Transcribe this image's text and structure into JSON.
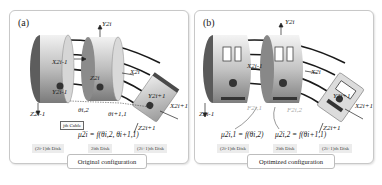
{
  "panels": [
    {
      "tag": "(a)",
      "caption": "Original configuration",
      "axis_labels": {
        "y_2i": "Y2i",
        "x_2i_minus_1": "X2i-1",
        "z_2i": "Z2i",
        "x_2i": "X2i",
        "y_2i_minus_1": "Y2i-1",
        "z_2i_minus_1": "Z2i-1",
        "y_2i_plus_1": "Y2i+1",
        "x_2i_plus_1": "X2i+1",
        "z_2i_plus_1": "Z2i+1",
        "theta_i2": "θi,2",
        "theta_i_plus_1_1": "θi+1,1"
      },
      "cable_label": "jth Cable",
      "equation": "μ2i = f(θi,2, θi+1,1)",
      "disks": [
        "(2i-1)th Disk",
        "2ith Disk",
        "(2i+1)th Disk"
      ]
    },
    {
      "tag": "(b)",
      "caption": "Optimized configuration",
      "axis_labels": {
        "y_2i": "Y2i",
        "x_2i_minus_1": "X2i-1",
        "x_2i": "X2i",
        "z_2i_minus_1": "Z2i-1",
        "y_2i_plus_1": "Y2i+1",
        "x_2i_plus_1": "X2i+1",
        "z_2i_plus_1": "Z2i+1",
        "f_left": "F2i,1",
        "f_right": "F2i,2"
      },
      "equations": [
        "μ2i,1 = f(θi,2)",
        "μ2i,2 = f(θi+1,1)"
      ],
      "disks": [
        "(2i-1)th Disk",
        "2ith Disk",
        "(2i+1)th Disk"
      ]
    }
  ]
}
